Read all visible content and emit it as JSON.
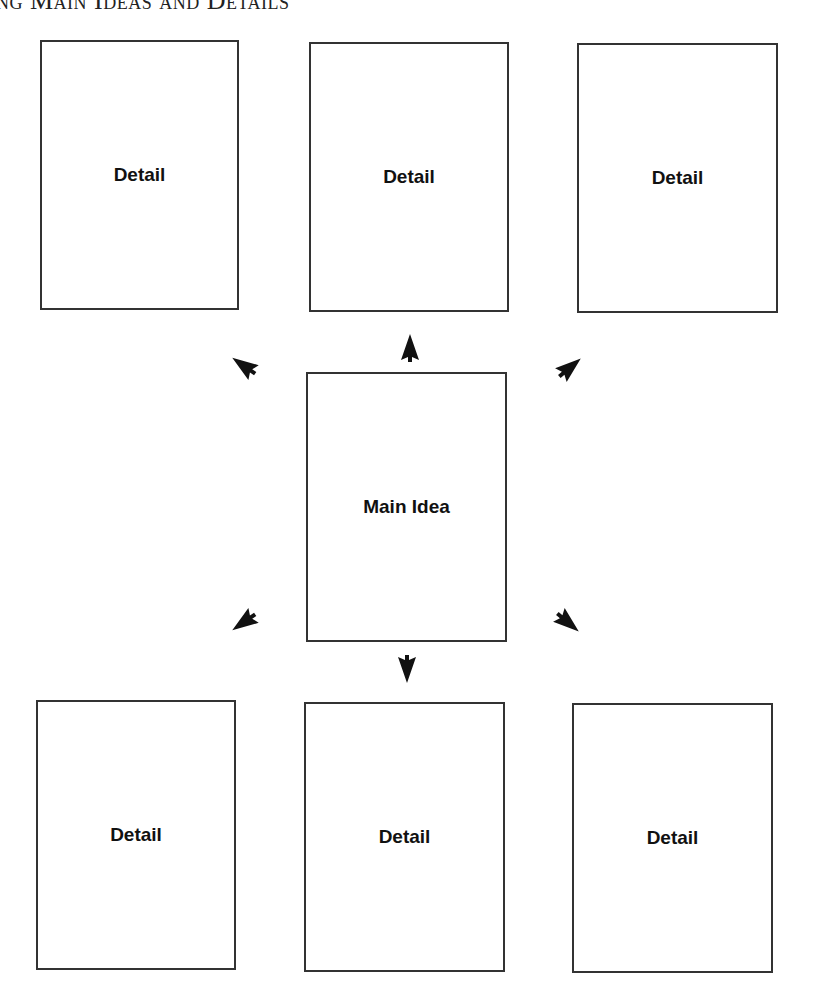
{
  "title": "ng Main Ideas and Details",
  "main_idea": {
    "label": "Main Idea"
  },
  "details_top": [
    {
      "label": "Detail"
    },
    {
      "label": "Detail"
    },
    {
      "label": "Detail"
    }
  ],
  "details_bottom": [
    {
      "label": "Detail"
    },
    {
      "label": "Detail"
    },
    {
      "label": "Detail"
    }
  ],
  "arrows": [
    "up",
    "up-left",
    "up-right",
    "down",
    "down-left",
    "down-right"
  ],
  "colors": {
    "border": "#333333",
    "arrow": "#111111",
    "text": "#111111"
  }
}
